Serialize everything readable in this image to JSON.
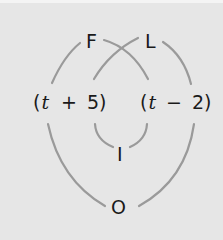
{
  "diagram": {
    "type": "FOIL multiplication diagram",
    "nodes": {
      "F": "F",
      "L": "L",
      "I": "I",
      "O": "O"
    },
    "factors": {
      "left": {
        "open": "(",
        "var": "t",
        "op": "+",
        "num": "5",
        "close": ")"
      },
      "right": {
        "open": "(",
        "var": "t",
        "op": "−",
        "num": "2",
        "close": ")"
      }
    },
    "connections": [
      {
        "label": "F",
        "from": "left.t",
        "to": "right.t"
      },
      {
        "label": "L",
        "from": "left.5",
        "to": "right.2"
      },
      {
        "label": "I",
        "from": "left.5",
        "to": "right.t"
      },
      {
        "label": "O",
        "from": "left.t",
        "to": "right.2"
      }
    ],
    "colors": {
      "background": "#e6e6e6",
      "arc": "#9a9a9a",
      "text": "#1a1a1a"
    }
  }
}
